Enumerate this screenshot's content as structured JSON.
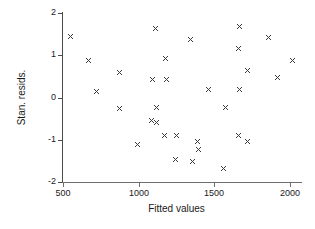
{
  "chart_data": {
    "type": "scatter",
    "title": "",
    "xlabel": "Fitted values",
    "ylabel": "Stan. resids.",
    "xlim": [
      440,
      2090
    ],
    "ylim": [
      -2,
      2
    ],
    "grid": false,
    "legend": null,
    "marker": "x",
    "marker_color": "#3a3a3a",
    "xticks": [
      500,
      1000,
      1500,
      2000
    ],
    "xtick_labels": [
      "500",
      "1000",
      "1500",
      "2000"
    ],
    "yticks": [
      2,
      1,
      0,
      -1,
      -2
    ],
    "ytick_labels": [
      "2",
      "1",
      "0",
      "-1",
      "-2"
    ],
    "n_points": 38,
    "points": [
      {
        "x": 547,
        "y": 1.45
      },
      {
        "x": 669,
        "y": 0.88
      },
      {
        "x": 871,
        "y": 0.58
      },
      {
        "x": 723,
        "y": 0.14
      },
      {
        "x": 872,
        "y": -0.27
      },
      {
        "x": 993,
        "y": -1.11
      },
      {
        "x": 1114,
        "y": 1.63
      },
      {
        "x": 1175,
        "y": 0.92
      },
      {
        "x": 1094,
        "y": 0.43
      },
      {
        "x": 1182,
        "y": 0.42
      },
      {
        "x": 1120,
        "y": -0.24
      },
      {
        "x": 1087,
        "y": -0.55
      },
      {
        "x": 1121,
        "y": -0.58
      },
      {
        "x": 1168,
        "y": -0.9
      },
      {
        "x": 1249,
        "y": -0.9
      },
      {
        "x": 1243,
        "y": -1.47
      },
      {
        "x": 1344,
        "y": 1.37
      },
      {
        "x": 1391,
        "y": -1.05
      },
      {
        "x": 1398,
        "y": -1.24
      },
      {
        "x": 1358,
        "y": -1.52
      },
      {
        "x": 1459,
        "y": 0.2
      },
      {
        "x": 1560,
        "y": -1.67
      },
      {
        "x": 1668,
        "y": 1.69
      },
      {
        "x": 1661,
        "y": 1.15
      },
      {
        "x": 1722,
        "y": 0.65
      },
      {
        "x": 1668,
        "y": 0.19
      },
      {
        "x": 1574,
        "y": -0.23
      },
      {
        "x": 1661,
        "y": -0.89
      },
      {
        "x": 1722,
        "y": -1.04
      },
      {
        "x": 1857,
        "y": 1.43
      },
      {
        "x": 1918,
        "y": 0.48
      },
      {
        "x": 2019,
        "y": 0.88
      }
    ]
  },
  "axes": {
    "y_title": "Stan. resids.",
    "x_title": "Fitted values"
  }
}
